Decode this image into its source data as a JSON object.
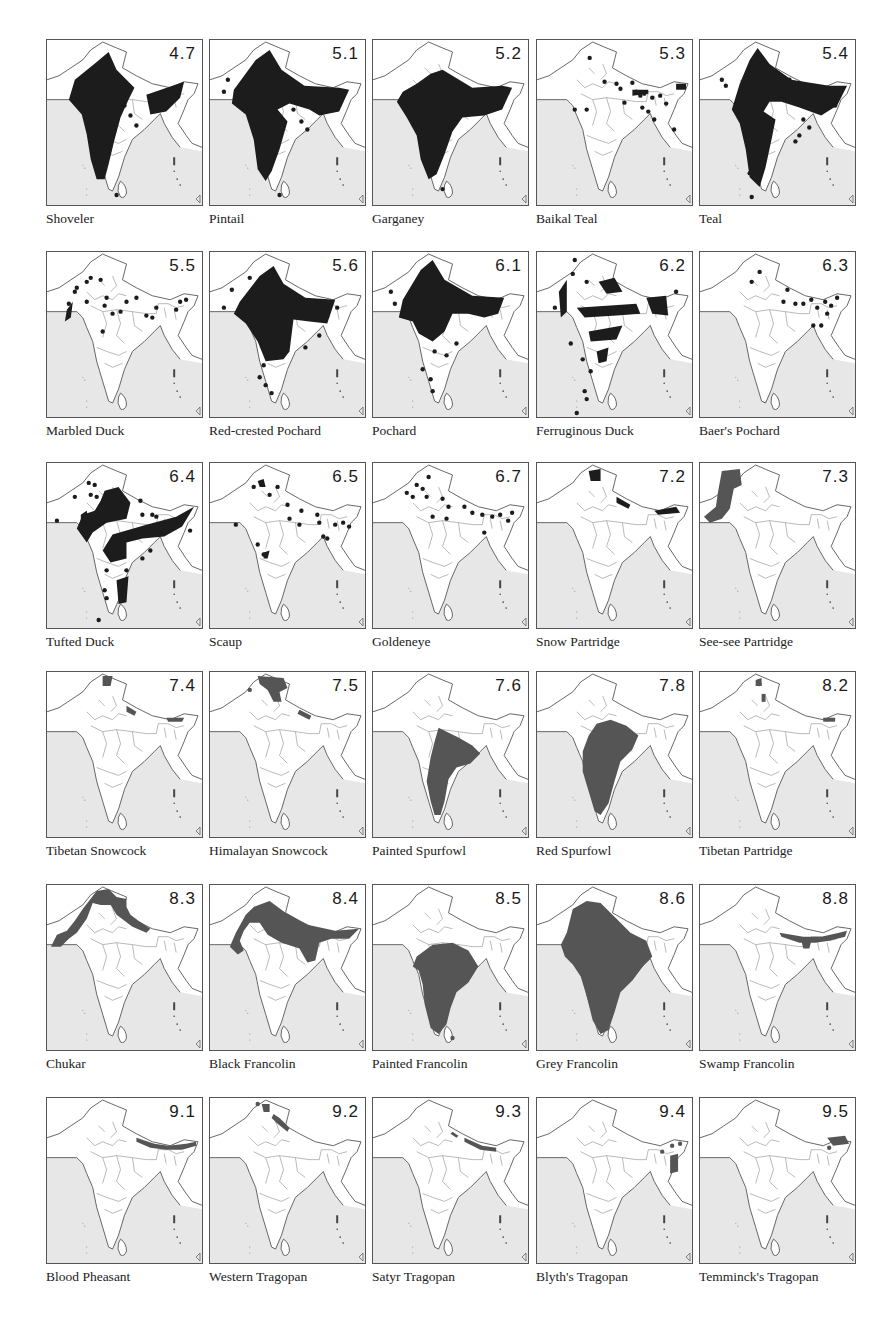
{
  "colors": {
    "sea": "#e7e7e7",
    "land": "#ffffff",
    "outline": "#555555",
    "range_dark": "#1c1c1c",
    "range_grey": "#555555"
  },
  "layout": {
    "col_x": [
      46,
      209,
      372,
      536,
      699
    ],
    "row_y": [
      39,
      251,
      462,
      671,
      884,
      1097
    ]
  },
  "maps": [
    {
      "num": "4.7",
      "label": "Shoveler",
      "tone": "dark",
      "shapes": [
        "M28,40 L50,22 L62,12 L70,30 L88,48 L82,60 L74,78 L68,100 L62,125 L58,140 L50,140 L44,120 L40,95 L35,75 L22,60 Z",
        "M100,55 L138,42 L134,58 L120,72 L104,75 Z"
      ],
      "dots": [
        [
          78,
          66
        ],
        [
          84,
          76
        ],
        [
          90,
          86
        ],
        [
          70,
          156
        ]
      ]
    },
    {
      "num": "5.1",
      "label": "Pintail",
      "tone": "dark",
      "shapes": [
        "M24,50 L46,20 L60,10 L72,30 L95,46 L130,48 L140,50 L130,72 L110,76 L100,70 L80,64 L68,70 L78,82 L70,110 L62,132 L56,142 L48,130 L44,100 L36,75 L22,64 Z"
      ],
      "dots": [
        [
          14,
          52
        ],
        [
          18,
          40
        ],
        [
          84,
          70
        ],
        [
          92,
          82
        ],
        [
          98,
          90
        ],
        [
          70,
          156
        ]
      ]
    },
    {
      "num": "5.2",
      "label": "Garganey",
      "tone": "dark",
      "shapes": [
        "M58,34 L70,30 L100,48 L130,46 L140,48 L130,70 L112,76 L90,78 L80,92 L72,115 L64,135 L56,140 L48,120 L44,96 L34,78 L24,62 L30,52 L44,44 Z"
      ],
      "dots": [
        [
          70,
          150
        ]
      ]
    },
    {
      "num": "5.3",
      "label": "Baikal Teal",
      "tone": "dark",
      "shapes": [
        "M96,50 L112,50 L112,54 L96,56 Z",
        "M140,44 L150,44 L150,50 L140,50 Z"
      ],
      "dots": [
        [
          53,
          18
        ],
        [
          68,
          42
        ],
        [
          80,
          44
        ],
        [
          84,
          49
        ],
        [
          96,
          43
        ],
        [
          88,
          63
        ],
        [
          38,
          70
        ],
        [
          50,
          70
        ],
        [
          116,
          58
        ],
        [
          124,
          56
        ],
        [
          106,
          68
        ],
        [
          112,
          72
        ],
        [
          118,
          80
        ],
        [
          130,
          64
        ],
        [
          138,
          90
        ],
        [
          100,
          52
        ],
        [
          104,
          56
        ],
        [
          108,
          54
        ]
      ]
    },
    {
      "num": "5.4",
      "label": "Teal",
      "tone": "dark",
      "shapes": [
        "M40,44 L50,20 L58,8 L70,24 L92,40 L130,46 L148,46 L138,66 L122,76 L100,68 L82,62 L70,62 L64,72 L76,80 L72,100 L66,128 L60,148 L50,138 L46,110 L40,84 L32,70 Z"
      ],
      "dots": [
        [
          22,
          40
        ],
        [
          26,
          46
        ],
        [
          90,
          40
        ],
        [
          128,
          50
        ],
        [
          136,
          66
        ],
        [
          104,
          80
        ],
        [
          110,
          88
        ],
        [
          100,
          96
        ],
        [
          96,
          102
        ],
        [
          50,
          134
        ],
        [
          52,
          158
        ]
      ]
    },
    {
      "num": "5.5",
      "label": "Marbled Duck",
      "tone": "dark",
      "shapes": [
        "M20,58 L26,50 L24,66 L18,70 Z"
      ],
      "dots": [
        [
          44,
          26
        ],
        [
          40,
          30
        ],
        [
          54,
          28
        ],
        [
          30,
          36
        ],
        [
          28,
          40
        ],
        [
          22,
          52
        ],
        [
          40,
          50
        ],
        [
          60,
          46
        ],
        [
          58,
          54
        ],
        [
          80,
          50
        ],
        [
          66,
          62
        ],
        [
          74,
          60
        ],
        [
          90,
          46
        ],
        [
          110,
          56
        ],
        [
          134,
          50
        ],
        [
          140,
          48
        ],
        [
          130,
          58
        ],
        [
          100,
          64
        ],
        [
          56,
          80
        ],
        [
          106,
          66
        ]
      ]
    },
    {
      "num": "5.6",
      "label": "Red-crested Pochard",
      "tone": "dark",
      "shapes": [
        "M30,50 L50,24 L64,14 L74,32 L96,46 L126,48 L118,72 L100,70 L84,68 L80,100 L74,108 L56,110 L48,90 L36,72 L24,62 Z"
      ],
      "dots": [
        [
          22,
          38
        ],
        [
          40,
          26
        ],
        [
          14,
          56
        ],
        [
          110,
          84
        ],
        [
          96,
          96
        ],
        [
          54,
          114
        ],
        [
          50,
          126
        ],
        [
          56,
          134
        ],
        [
          62,
          142
        ],
        [
          128,
          56
        ]
      ]
    },
    {
      "num": "6.1",
      "label": "Pochard",
      "tone": "dark",
      "shapes": [
        "M30,48 L48,18 L60,8 L72,28 L100,44 L132,46 L126,62 L112,66 L96,62 L80,62 L72,80 L60,90 L46,82 L40,70 L26,66 Z",
        "M104,48 L124,48 L120,62 L106,62 Z"
      ],
      "dots": [
        [
          18,
          40
        ],
        [
          22,
          52
        ],
        [
          62,
          100
        ],
        [
          74,
          104
        ],
        [
          84,
          92
        ],
        [
          50,
          118
        ],
        [
          58,
          128
        ],
        [
          60,
          140
        ]
      ]
    },
    {
      "num": "6.2",
      "label": "Ferruginous Duck",
      "tone": "dark",
      "shapes": [
        "M62,30 L78,26 L86,40 L70,42 Z",
        "M22,40 L30,28 L30,60 L24,66 Z",
        "M40,56 L100,52 L104,62 L80,64 L48,66 Z",
        "M52,80 L86,74 L80,88 L54,90 Z",
        "M110,46 L130,44 L132,64 L116,62 Z",
        "M60,100 L72,96 L70,110 L62,112 Z"
      ],
      "dots": [
        [
          38,
          8
        ],
        [
          36,
          22
        ],
        [
          50,
          30
        ],
        [
          18,
          56
        ],
        [
          34,
          92
        ],
        [
          46,
          108
        ],
        [
          54,
          120
        ],
        [
          48,
          140
        ],
        [
          50,
          148
        ],
        [
          40,
          162
        ],
        [
          140,
          40
        ],
        [
          128,
          54
        ]
      ]
    },
    {
      "num": "6.3",
      "label": "Baer's Pochard",
      "tone": "dark",
      "shapes": [],
      "dots": [
        [
          60,
          20
        ],
        [
          52,
          30
        ],
        [
          88,
          38
        ],
        [
          84,
          50
        ],
        [
          96,
          52
        ],
        [
          104,
          52
        ],
        [
          112,
          48
        ],
        [
          118,
          56
        ],
        [
          126,
          50
        ],
        [
          132,
          54
        ],
        [
          138,
          46
        ],
        [
          128,
          62
        ],
        [
          122,
          74
        ],
        [
          114,
          74
        ]
      ]
    },
    {
      "num": "6.4",
      "label": "Tufted Duck",
      "tone": "dark",
      "shapes": [
        "M58,28 L72,24 L84,40 L80,56 L60,60 L46,70 L40,80 L30,66 L36,52 L48,48 L54,38 Z",
        "M66,72 L100,62 L130,54 L148,44 L136,64 L118,74 L96,76 L80,80 L80,96 L64,100 L56,88 Z",
        "M70,118 L82,114 L80,140 L72,142 Z",
        "M34,52 L40,48 L42,60 L34,62 Z"
      ],
      "dots": [
        [
          42,
          20
        ],
        [
          48,
          22
        ],
        [
          28,
          34
        ],
        [
          44,
          32
        ],
        [
          50,
          34
        ],
        [
          10,
          58
        ],
        [
          94,
          38
        ],
        [
          96,
          52
        ],
        [
          106,
          52
        ],
        [
          110,
          54
        ],
        [
          144,
          68
        ],
        [
          104,
          88
        ],
        [
          96,
          96
        ],
        [
          60,
          108
        ],
        [
          80,
          108
        ],
        [
          58,
          128
        ],
        [
          60,
          136
        ],
        [
          52,
          158
        ]
      ]
    },
    {
      "num": "6.5",
      "label": "Scaup",
      "tone": "dark",
      "shapes": [
        "M48,18 L54,16 L56,24 L50,24 Z",
        "M54,90 L60,88 L58,96 L54,96 Z"
      ],
      "dots": [
        [
          44,
          24
        ],
        [
          68,
          24
        ],
        [
          60,
          32
        ],
        [
          78,
          42
        ],
        [
          92,
          48
        ],
        [
          108,
          52
        ],
        [
          80,
          56
        ],
        [
          110,
          60
        ],
        [
          90,
          62
        ],
        [
          126,
          62
        ],
        [
          134,
          60
        ],
        [
          114,
          74
        ],
        [
          118,
          76
        ],
        [
          140,
          64
        ],
        [
          26,
          62
        ],
        [
          48,
          82
        ],
        [
          54,
          92
        ]
      ]
    },
    {
      "num": "6.7",
      "label": "Goldeneye",
      "tone": "dark",
      "shapes": [],
      "dots": [
        [
          44,
          22
        ],
        [
          56,
          14
        ],
        [
          50,
          26
        ],
        [
          34,
          30
        ],
        [
          40,
          34
        ],
        [
          54,
          34
        ],
        [
          70,
          36
        ],
        [
          76,
          44
        ],
        [
          92,
          44
        ],
        [
          100,
          50
        ],
        [
          110,
          52
        ],
        [
          120,
          54
        ],
        [
          128,
          52
        ],
        [
          136,
          58
        ],
        [
          140,
          50
        ],
        [
          60,
          54
        ],
        [
          74,
          56
        ],
        [
          112,
          70
        ]
      ]
    },
    {
      "num": "7.2",
      "label": "Snow Partridge",
      "tone": "dark",
      "shapes": [
        "M52,8 L64,6 L64,18 L54,18 Z",
        "M80,34 L94,42 L92,46 L80,40 Z",
        "M118,48 L140,44 L144,50 L122,52 Z"
      ],
      "dots": []
    },
    {
      "num": "7.3",
      "label": "See-see Partridge",
      "tone": "grey",
      "shapes": [
        "M22,8 L40,6 L42,22 L34,26 L30,46 L22,56 L10,60 L4,54 L16,44 L18,30 Z"
      ],
      "dots": []
    },
    {
      "num": "7.4",
      "label": "Tibetan Snowcock",
      "tone": "grey",
      "shapes": [
        "M56,4 L66,4 L64,14 L56,14 Z",
        "M80,34 L90,40 L88,44 L80,40 Z",
        "M120,46 L138,46 L136,50 L122,50 Z"
      ],
      "dots": []
    },
    {
      "num": "7.5",
      "label": "Himalayan Snowcock",
      "tone": "grey",
      "shapes": [
        "M48,4 L74,6 L78,16 L70,20 L72,30 L64,30 L58,18 L50,12 Z",
        "M90,38 L102,44 L100,48 L88,42 Z"
      ],
      "dots": [
        [
          40,
          18
        ]
      ]
    },
    {
      "num": "7.6",
      "label": "Painted Spurfowl",
      "tone": "grey",
      "shapes": [
        "M66,56 L86,66 L100,74 L108,82 L98,92 L84,96 L76,108 L72,130 L68,144 L62,144 L58,130 L54,110 L58,86 L62,70 Z"
      ],
      "dots": []
    },
    {
      "num": "7.8",
      "label": "Red Spurfowl",
      "tone": "grey",
      "shapes": [
        "M60,52 L74,48 L90,54 L102,64 L96,78 L84,90 L78,110 L72,132 L64,144 L58,140 L52,120 L46,100 L46,80 L52,64 Z"
      ],
      "dots": []
    },
    {
      "num": "8.2",
      "label": "Tibetan Partridge",
      "tone": "grey",
      "shapes": [
        "M56,8 L62,6 L62,14 L56,14 Z",
        "M62,22 L66,22 L66,30 L62,30 Z",
        "M124,46 L136,46 L136,50 L124,50 Z"
      ],
      "dots": [
        [
          60,
          12
        ]
      ]
    },
    {
      "num": "8.3",
      "label": "Chukar",
      "tone": "grey",
      "shapes": [
        "M50,6 L62,4 L70,12 L80,14 L80,22 L84,30 L92,36 L104,44 L100,48 L86,42 L70,30 L64,20 L54,20 L46,18 L40,34 L30,48 L22,54 L14,62 L4,62 L10,50 L20,46 L28,36 L36,24 Z"
      ],
      "dots": []
    },
    {
      "num": "8.4",
      "label": "Black Francolin",
      "tone": "grey",
      "shapes": [
        "M44,22 L60,16 L76,28 L98,40 L126,46 L150,44 L140,54 L122,54 L110,58 L106,76 L98,78 L90,64 L72,58 L58,50 L50,38 L40,38 L34,46 L30,56 L34,66 L28,70 L20,62 L26,48 L36,30 Z"
      ],
      "dots": []
    },
    {
      "num": "8.5",
      "label": "Painted Francolin",
      "tone": "grey",
      "shapes": [
        "M44,72 L60,60 L80,58 L96,66 L106,82 L96,98 L84,108 L78,124 L74,140 L66,150 L58,144 L52,120 L50,100 L46,86 L40,82 Z"
      ],
      "dots": [
        [
          80,
          154
        ]
      ]
    },
    {
      "num": "8.6",
      "label": "Grey Francolin",
      "tone": "grey",
      "shapes": [
        "M36,24 L50,16 L64,18 L80,34 L94,48 L110,56 L116,72 L108,80 L96,96 L84,108 L78,128 L72,146 L64,150 L56,136 L50,112 L44,92 L36,80 L28,72 L24,60 L30,48 Z"
      ],
      "dots": []
    },
    {
      "num": "8.8",
      "label": "Swamp Francolin",
      "tone": "grey",
      "shapes": [
        "M80,48 L104,52 L122,52 L140,48 L148,46 L146,52 L130,56 L116,58 L100,58 L82,52 Z",
        "M102,56 L112,56 L110,64 L104,64 Z"
      ],
      "dots": []
    },
    {
      "num": "9.1",
      "label": "Blood Pheasant",
      "tone": "grey",
      "shapes": [
        "M90,40 L108,46 L122,48 L140,46 L150,44 L150,48 L136,52 L120,52 L104,50 L90,44 Z"
      ],
      "dots": []
    },
    {
      "num": "9.2",
      "label": "Western Tragopan",
      "tone": "grey",
      "shapes": [
        "M52,6 L60,6 L60,14 L54,14 Z",
        "M64,16 L70,20 L80,30 L78,34 L68,26 L62,20 Z"
      ],
      "dots": [
        [
          48,
          6
        ]
      ]
    },
    {
      "num": "9.3",
      "label": "Satyr Tragopan",
      "tone": "grey",
      "shapes": [
        "M80,34 L86,38 L84,40 L78,36 Z",
        "M92,40 L110,48 L124,50 L124,54 L108,52 L92,44 Z"
      ],
      "dots": []
    },
    {
      "num": "9.4",
      "label": "Blyth's Tragopan",
      "tone": "grey",
      "shapes": [
        "M134,58 L142,56 L142,74 L134,76 Z"
      ],
      "dots": [
        [
          136,
          48
        ],
        [
          144,
          46
        ],
        [
          126,
          54
        ]
      ]
    },
    {
      "num": "9.5",
      "label": "Temminck's Tragopan",
      "tone": "grey",
      "shapes": [
        "M128,40 L146,38 L150,46 L134,48 Z"
      ],
      "dots": [
        [
          130,
          50
        ]
      ]
    }
  ]
}
